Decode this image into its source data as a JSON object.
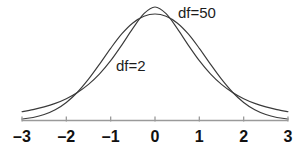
{
  "figure": {
    "background_color": "#ffffff",
    "width": 305,
    "height": 154
  },
  "chart_data": {
    "type": "line",
    "title": "",
    "subtitle": "",
    "xlabel": "",
    "ylabel": "",
    "xlim": [
      -3,
      3
    ],
    "ylim": [
      0,
      0.42
    ],
    "grid": false,
    "legend_position": "inline-annotation",
    "x_ticks": [
      -3,
      -2,
      -1,
      0,
      1,
      2,
      3
    ],
    "x_tick_labels": [
      "–3",
      "–2",
      "–1",
      "0",
      "1",
      "2",
      "3"
    ],
    "y_ticks": [],
    "y_tick_labels": [],
    "annotations": [
      {
        "text": "df=50",
        "x": 1.2,
        "y": 0.4
      },
      {
        "text": "df=2",
        "x": -0.8,
        "y": 0.2
      }
    ],
    "series": [
      {
        "name": "df=50",
        "label": "df=50",
        "color": "#3a3a3a",
        "peak_x": 0,
        "peak_y": 0.397,
        "x": [
          -3.0,
          -2.75,
          -2.5,
          -2.25,
          -2.0,
          -1.75,
          -1.5,
          -1.25,
          -1.0,
          -0.75,
          -0.5,
          -0.25,
          0.0,
          0.25,
          0.5,
          0.75,
          1.0,
          1.25,
          1.5,
          1.75,
          2.0,
          2.25,
          2.5,
          2.75,
          3.0
        ],
        "values": [
          0.0046,
          0.0095,
          0.0185,
          0.0334,
          0.0562,
          0.088,
          0.1286,
          0.1757,
          0.2248,
          0.2697,
          0.3039,
          0.3246,
          0.3317,
          0.3246,
          0.3039,
          0.2697,
          0.2248,
          0.1757,
          0.1286,
          0.088,
          0.0562,
          0.0334,
          0.0185,
          0.0095,
          0.0046
        ]
      },
      {
        "name": "df=2",
        "label": "df=2",
        "color": "#3a3a3a",
        "peak_x": 0,
        "peak_y": 0.354,
        "x": [
          -3.0,
          -2.75,
          -2.5,
          -2.25,
          -2.0,
          -1.75,
          -1.5,
          -1.25,
          -1.0,
          -0.75,
          -0.5,
          -0.25,
          0.0,
          0.25,
          0.5,
          0.75,
          1.0,
          1.25,
          1.5,
          1.75,
          2.0,
          2.25,
          2.5,
          2.75,
          3.0
        ],
        "values": [
          0.0274,
          0.034,
          0.0424,
          0.0534,
          0.068,
          0.0872,
          0.1125,
          0.1452,
          0.1863,
          0.235,
          0.2868,
          0.3328,
          0.3536,
          0.3328,
          0.2868,
          0.235,
          0.1863,
          0.1452,
          0.1125,
          0.0872,
          0.068,
          0.0534,
          0.0424,
          0.034,
          0.0274
        ]
      }
    ]
  },
  "axis": {
    "line_color": "#9a9a9a",
    "tick_color": "#9a9a9a"
  }
}
